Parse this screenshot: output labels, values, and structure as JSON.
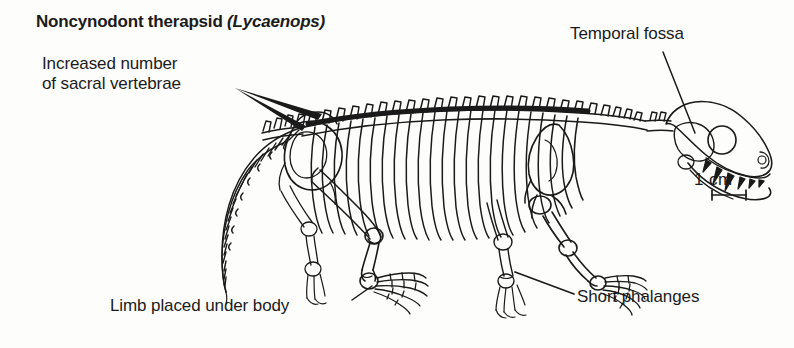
{
  "figure": {
    "title_main": "Noncynodont therapsid ",
    "title_genus": "(Lycaenops)",
    "background_color": "#fdfdfc",
    "ink_color": "#1a1a1a"
  },
  "annotations": {
    "sacral": {
      "line1": "Increased number",
      "line2": "of sacral vertebrae",
      "target": "sacral-vertebrae"
    },
    "temporal": {
      "text": "Temporal fossa",
      "target": "skull-temporal-opening"
    },
    "limb": {
      "text": "Limb placed under body",
      "target": "hind-limb"
    },
    "phalanges": {
      "text": "Short phalanges",
      "target": "forefoot-phalanges"
    }
  },
  "scalebar": {
    "text": "1 cm",
    "length_px": 34
  }
}
